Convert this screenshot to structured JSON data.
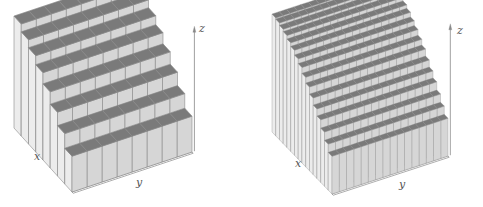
{
  "chart_data": [
    {
      "type": "bar3d",
      "title": "",
      "grid": [
        8,
        8
      ],
      "xlabel": "x",
      "ylabel": "y",
      "zlabel": "z",
      "description": "3D histogram, staircase decreasing toward front (x increasing)",
      "row_heights": [
        1.0,
        0.93,
        0.86,
        0.78,
        0.68,
        0.57,
        0.45,
        0.32
      ],
      "colors": {
        "top": "#7a7a7a",
        "front": "#d6d6d6",
        "side": "#ececec",
        "edge": "#8a8a8a"
      }
    },
    {
      "type": "bar3d",
      "title": "",
      "grid": [
        16,
        16
      ],
      "xlabel": "x",
      "ylabel": "y",
      "zlabel": "z",
      "description": "3D histogram with finer bins, smooth concave decreasing surface toward front",
      "row_heights": [
        1.0,
        0.99,
        0.97,
        0.95,
        0.92,
        0.89,
        0.85,
        0.81,
        0.76,
        0.71,
        0.65,
        0.59,
        0.53,
        0.46,
        0.39,
        0.32
      ],
      "colors": {
        "top": "#7a7a7a",
        "front": "#d6d6d6",
        "side": "#ececec",
        "edge": "#8a8a8a"
      }
    }
  ],
  "panels": [
    {
      "labels": {
        "x": "x",
        "y": "y",
        "z": "z"
      }
    },
    {
      "labels": {
        "x": "x",
        "y": "y",
        "z": "z"
      }
    }
  ]
}
